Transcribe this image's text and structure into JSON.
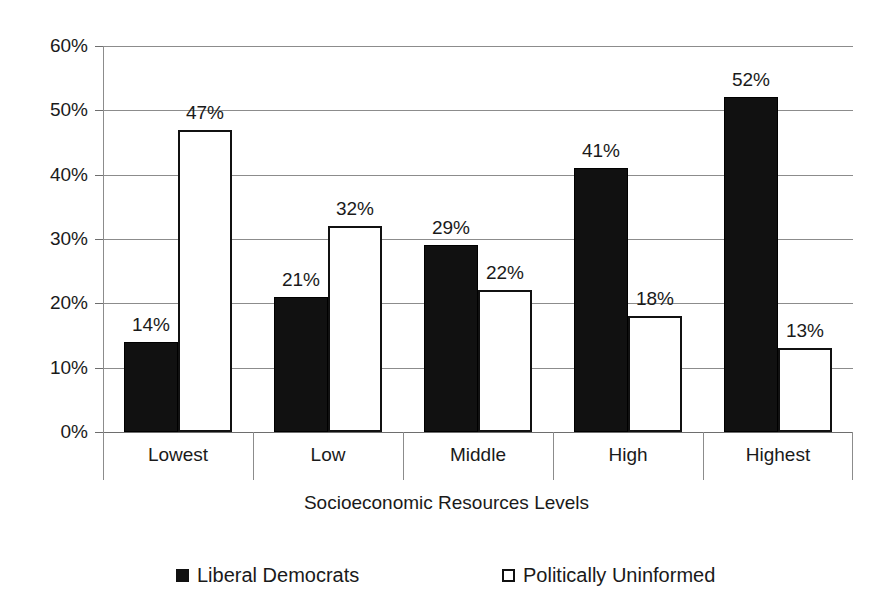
{
  "chart_data": {
    "type": "bar",
    "title": "",
    "subtitle": "",
    "xlabel": "Socioeconomic Resources Levels",
    "ylabel": "",
    "categories": [
      "Lowest",
      "Low",
      "Middle",
      "High",
      "Highest"
    ],
    "series": [
      {
        "name": "Liberal Democrats",
        "swatch": "dark",
        "color": "#111111",
        "values": [
          14,
          21,
          29,
          41,
          52
        ],
        "value_labels": [
          "14%",
          "21%",
          "29%",
          "41%",
          "52%"
        ]
      },
      {
        "name": "Politically Uninformed",
        "swatch": "light",
        "color": "#ffffff",
        "values": [
          47,
          32,
          22,
          18,
          13
        ],
        "value_labels": [
          "47%",
          "32%",
          "22%",
          "18%",
          "13%"
        ]
      }
    ],
    "ylim": [
      0,
      60
    ],
    "ytick_values": [
      60,
      50,
      40,
      30,
      20,
      10,
      0
    ],
    "ytick_labels": [
      "60%",
      "50%",
      "40%",
      "30%",
      "20%",
      "10%",
      "0%"
    ],
    "grid": true,
    "legend_position": "bottom"
  },
  "axis": {
    "y_labels": [
      "60%",
      "50%",
      "40%",
      "30%",
      "20%",
      "10%",
      "0%"
    ],
    "x_title": "Socioeconomic Resources Levels",
    "x_categories": [
      "Lowest",
      "Low",
      "Middle",
      "High",
      "Highest"
    ]
  },
  "legend": {
    "items": [
      {
        "label": "Liberal Democrats",
        "swatch": "dark"
      },
      {
        "label": "Politically Uninformed",
        "swatch": "light"
      }
    ]
  },
  "colors": {
    "series_dark": "#111111",
    "series_light": "#ffffff",
    "gridline": "#8c8c8c",
    "text": "#1a1a1a",
    "background": "#ffffff"
  }
}
